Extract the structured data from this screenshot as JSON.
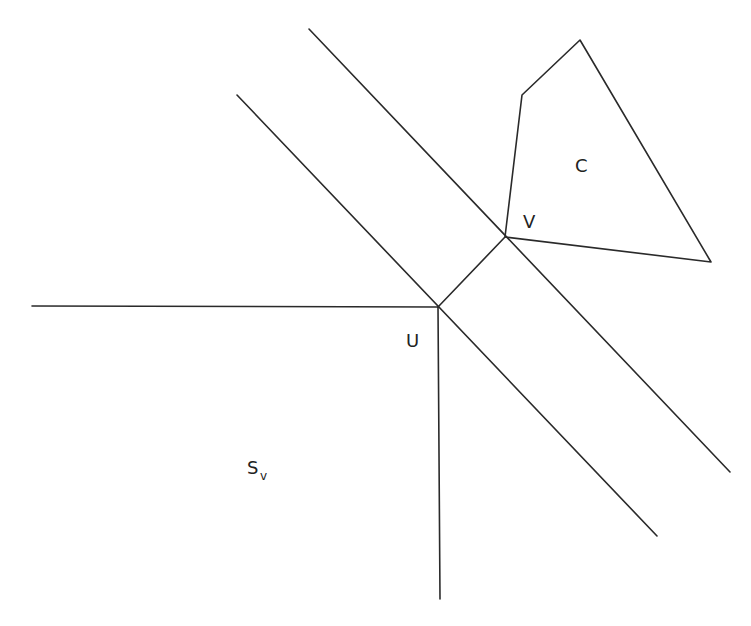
{
  "diagram": {
    "labels": {
      "u": "U",
      "v": "V",
      "c": "C",
      "s_main": "S",
      "s_sub": "v"
    },
    "points": {
      "U": [
        438,
        307
      ],
      "V": [
        505,
        237
      ]
    },
    "lines": [
      {
        "name": "upper-diagonal",
        "from": [
          309,
          29
        ],
        "to": [
          730,
          472
        ]
      },
      {
        "name": "lower-diagonal",
        "from": [
          237,
          95
        ],
        "to": [
          657,
          536
        ]
      },
      {
        "name": "horizontal-ray",
        "from": [
          32,
          306
        ],
        "to": [
          438,
          307
        ]
      },
      {
        "name": "vertical-ray",
        "from": [
          438,
          307
        ],
        "to": [
          440,
          599
        ]
      },
      {
        "name": "segment-uv",
        "from": [
          438,
          307
        ],
        "to": [
          505,
          237
        ]
      }
    ],
    "polygon_c": [
      [
        505,
        237
      ],
      [
        522,
        95
      ],
      [
        580,
        40
      ],
      [
        711,
        262
      ]
    ],
    "stroke_color": "#2a2a2a"
  }
}
